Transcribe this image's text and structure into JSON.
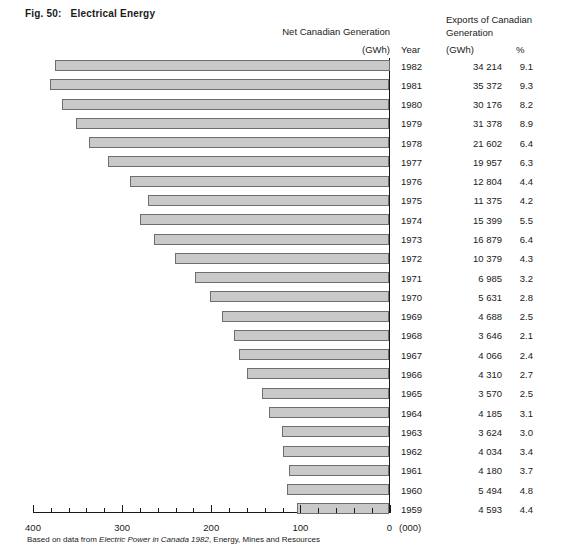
{
  "figure": {
    "number": "Fig. 50:",
    "title": "Electrical Energy"
  },
  "headers": {
    "net_generation": "Net Canadian Generation",
    "net_generation_unit": "(GWh)",
    "exports_line1": "Exports of Canadian",
    "exports_line2": "Generation",
    "year": "Year",
    "exports_gwh": "(GWh)",
    "exports_pct": "%"
  },
  "axis": {
    "unit": "(000)",
    "ticks": [
      "400",
      "300",
      "200",
      "100",
      "0"
    ]
  },
  "footnote": {
    "prefix": "Based on data from ",
    "source": "Electric Power in Canada 1982",
    "suffix": ", Energy, Mines and Resources"
  },
  "chart_data": {
    "type": "bar",
    "title": "Electrical Energy",
    "orientation": "horizontal",
    "xlabel": "Net Canadian Generation (GWh, thousands)",
    "ylabel": "Year",
    "xlim": [
      400,
      0
    ],
    "x_axis_reversed": true,
    "grid": false,
    "categories": [
      "1982",
      "1981",
      "1980",
      "1979",
      "1978",
      "1977",
      "1976",
      "1975",
      "1974",
      "1973",
      "1972",
      "1971",
      "1970",
      "1969",
      "1968",
      "1967",
      "1966",
      "1965",
      "1964",
      "1963",
      "1962",
      "1961",
      "1960",
      "1959"
    ],
    "series": [
      {
        "name": "Net Canadian Generation (000 GWh)",
        "values": [
          375,
          381,
          368,
          352,
          337,
          316,
          291,
          271,
          280,
          264,
          241,
          218,
          201,
          188,
          174,
          169,
          160,
          143,
          135,
          121,
          119,
          113,
          115,
          104
        ]
      }
    ],
    "rows": [
      {
        "year": "1982",
        "net_generation_000": 375,
        "exports_gwh": "34 214",
        "exports_pct": "9.1"
      },
      {
        "year": "1981",
        "net_generation_000": 381,
        "exports_gwh": "35 372",
        "exports_pct": "9.3"
      },
      {
        "year": "1980",
        "net_generation_000": 368,
        "exports_gwh": "30 176",
        "exports_pct": "8.2"
      },
      {
        "year": "1979",
        "net_generation_000": 352,
        "exports_gwh": "31 378",
        "exports_pct": "8.9"
      },
      {
        "year": "1978",
        "net_generation_000": 337,
        "exports_gwh": "21 602",
        "exports_pct": "6.4"
      },
      {
        "year": "1977",
        "net_generation_000": 316,
        "exports_gwh": "19 957",
        "exports_pct": "6.3"
      },
      {
        "year": "1976",
        "net_generation_000": 291,
        "exports_gwh": "12 804",
        "exports_pct": "4.4"
      },
      {
        "year": "1975",
        "net_generation_000": 271,
        "exports_gwh": "11 375",
        "exports_pct": "4.2"
      },
      {
        "year": "1974",
        "net_generation_000": 280,
        "exports_gwh": "15 399",
        "exports_pct": "5.5"
      },
      {
        "year": "1973",
        "net_generation_000": 264,
        "exports_gwh": "16 879",
        "exports_pct": "6.4"
      },
      {
        "year": "1972",
        "net_generation_000": 241,
        "exports_gwh": "10 379",
        "exports_pct": "4.3"
      },
      {
        "year": "1971",
        "net_generation_000": 218,
        "exports_gwh": "6 985",
        "exports_pct": "3.2"
      },
      {
        "year": "1970",
        "net_generation_000": 201,
        "exports_gwh": "5 631",
        "exports_pct": "2.8"
      },
      {
        "year": "1969",
        "net_generation_000": 188,
        "exports_gwh": "4 688",
        "exports_pct": "2.5"
      },
      {
        "year": "1968",
        "net_generation_000": 174,
        "exports_gwh": "3 646",
        "exports_pct": "2.1"
      },
      {
        "year": "1967",
        "net_generation_000": 169,
        "exports_gwh": "4 066",
        "exports_pct": "2.4"
      },
      {
        "year": "1966",
        "net_generation_000": 160,
        "exports_gwh": "4 310",
        "exports_pct": "2.7"
      },
      {
        "year": "1965",
        "net_generation_000": 143,
        "exports_gwh": "3 570",
        "exports_pct": "2.5"
      },
      {
        "year": "1964",
        "net_generation_000": 135,
        "exports_gwh": "4 185",
        "exports_pct": "3.1"
      },
      {
        "year": "1963",
        "net_generation_000": 121,
        "exports_gwh": "3 624",
        "exports_pct": "3.0"
      },
      {
        "year": "1962",
        "net_generation_000": 119,
        "exports_gwh": "4 034",
        "exports_pct": "3.4"
      },
      {
        "year": "1961",
        "net_generation_000": 113,
        "exports_gwh": "4 180",
        "exports_pct": "3.7"
      },
      {
        "year": "1960",
        "net_generation_000": 115,
        "exports_gwh": "5 494",
        "exports_pct": "4.8"
      },
      {
        "year": "1959",
        "net_generation_000": 104,
        "exports_gwh": "4 593",
        "exports_pct": "4.4"
      }
    ]
  }
}
